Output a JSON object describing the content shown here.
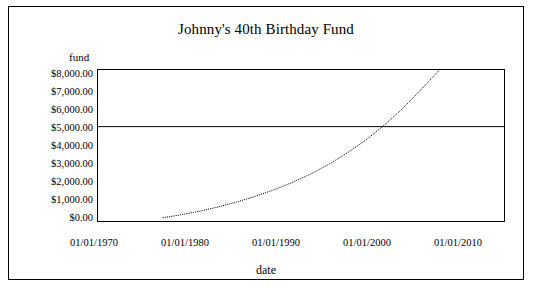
{
  "chart_data": {
    "type": "line",
    "title": "Johnny's 40th Birthday Fund",
    "xlabel": "date",
    "ylabel": "fund",
    "xlim": [
      "01/01/1968",
      "01/01/2012"
    ],
    "ylim": [
      0,
      8000
    ],
    "grid": false,
    "legend": null,
    "x_tick_labels": [
      "01/01/1970",
      "01/01/1980",
      "01/01/1990",
      "01/01/2000",
      "01/01/2010"
    ],
    "x_tick_values": [
      1970,
      1980,
      1990,
      2000,
      2010
    ],
    "y_tick_labels": [
      "$0.00",
      "$1,000.00",
      "$2,000.00",
      "$3,000.00",
      "$4,000.00",
      "$5,000.00",
      "$6,000.00",
      "$7,000.00",
      "$8,000.00"
    ],
    "y_tick_values": [
      0,
      1000,
      2000,
      3000,
      4000,
      5000,
      6000,
      7000,
      8000
    ],
    "series": [
      {
        "name": "fund",
        "style": "dotted",
        "color": "#000000",
        "x": [
          1975,
          1977,
          1979,
          1981,
          1983,
          1985,
          1987,
          1989,
          1991,
          1993,
          1995,
          1997,
          1999,
          2001,
          2003,
          2005
        ],
        "values": [
          170,
          330,
          520,
          740,
          1000,
          1300,
          1640,
          2030,
          2480,
          3000,
          3600,
          4280,
          5060,
          5950,
          6960,
          8000
        ]
      },
      {
        "name": "target-line",
        "style": "solid",
        "color": "#000000",
        "value": 5000
      }
    ]
  }
}
